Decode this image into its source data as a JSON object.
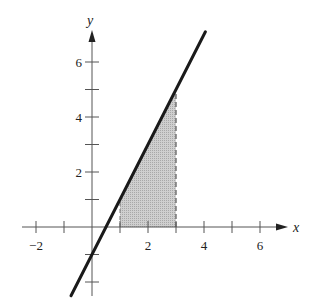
{
  "chart_data": {
    "type": "line",
    "title": "",
    "xlabel": "x",
    "ylabel": "y",
    "xlim": [
      -2.6,
      7
    ],
    "ylim": [
      -2.5,
      7.2
    ],
    "grid": false,
    "x_tick_labels": [
      "−2",
      "2",
      "4",
      "6"
    ],
    "x_tick_values": [
      -2,
      2,
      4,
      6
    ],
    "x_minor_ticks": [
      -2,
      -1,
      1,
      2,
      3,
      4,
      5,
      6
    ],
    "y_tick_labels": [
      "2",
      "4",
      "6"
    ],
    "y_tick_values": [
      2,
      4,
      6
    ],
    "y_minor_ticks": [
      -2,
      -1,
      1,
      2,
      3,
      4,
      5,
      6
    ],
    "series": [
      {
        "name": "y = 2x - 1",
        "x": [
          -0.75,
          4.05
        ],
        "y": [
          -2.5,
          7.1
        ]
      }
    ],
    "shaded_region": {
      "x_from": 1,
      "x_to": 3,
      "under": "y = 2x - 1",
      "right_edge": "dashed"
    },
    "colors": {
      "line": "#1a1a1a",
      "shade": "#c4c4c4",
      "axis": "#555555"
    }
  }
}
